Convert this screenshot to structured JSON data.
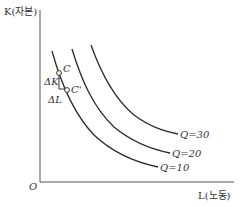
{
  "diagram": {
    "type": "isoquant",
    "y_axis_label": "K(자본)",
    "x_axis_label": "L(노동)",
    "origin_label": "O",
    "curves": [
      {
        "label": "Q=10",
        "name": "Q",
        "value": "10"
      },
      {
        "label": "Q=20",
        "name": "Q",
        "value": "20"
      },
      {
        "label": "Q=30",
        "name": "Q",
        "value": "30"
      }
    ],
    "points": [
      {
        "label": "C"
      },
      {
        "label": "C'"
      }
    ],
    "deltas": {
      "delta_k": "ΔK",
      "delta_l": "ΔL"
    },
    "colors": {
      "curve": "#2a2a2a",
      "axis": "#555555",
      "text": "#333333"
    }
  }
}
